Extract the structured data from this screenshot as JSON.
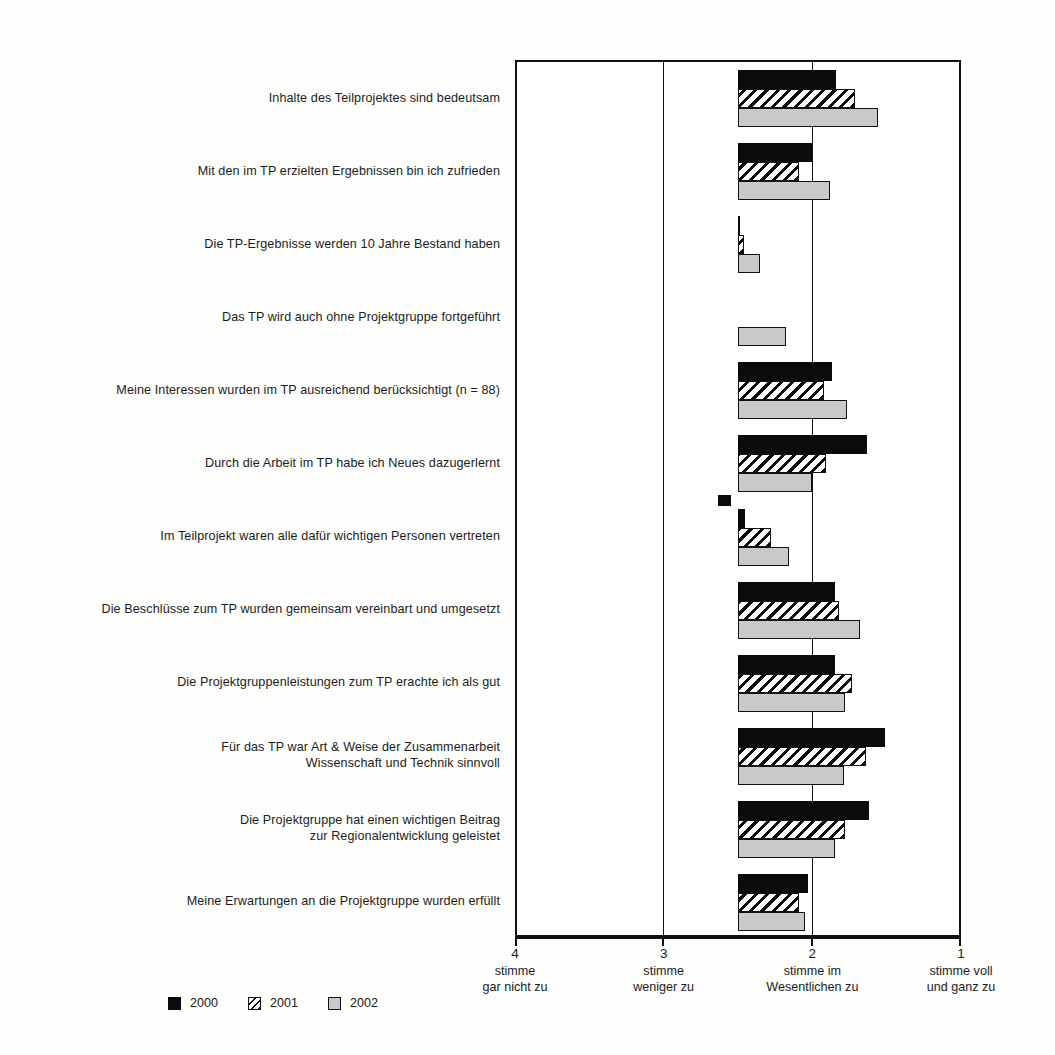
{
  "chart_data": {
    "type": "bar",
    "orientation": "horizontal",
    "title": "",
    "subtitle": "",
    "xlabel": "",
    "ylabel": "",
    "xlim": [
      4,
      1
    ],
    "x_inverted": true,
    "bar_baseline": 2.5,
    "grid": true,
    "gridlines": [
      4,
      3,
      2,
      1
    ],
    "legend_position": "bottom-left",
    "annotation": "n = 88",
    "axis_ticks": [
      {
        "value": "4",
        "line1": "stimme",
        "line2": "gar nicht zu"
      },
      {
        "value": "3",
        "line1": "stimme",
        "line2": "weniger zu"
      },
      {
        "value": "2",
        "line1": "stimme im",
        "line2": "Wesentlichen zu"
      },
      {
        "value": "1",
        "line1": "stimme voll",
        "line2": "und ganz zu"
      }
    ],
    "legend": [
      {
        "name": "2000",
        "color": "#0b0b0b",
        "pattern": "solid-black"
      },
      {
        "name": "2001",
        "color": "#ffffff",
        "pattern": "diagonal-hatch"
      },
      {
        "name": "2002",
        "color": "#c9c9c9",
        "pattern": "solid-gray"
      }
    ],
    "categories": [
      "Inhalte des Teilprojektes sind bedeutsam",
      "Mit den im TP erzielten Ergebnissen bin ich zufrieden",
      "Die TP-Ergebnisse werden 10 Jahre Bestand haben",
      "Das TP wird auch ohne Projektgruppe fortgeführt",
      "Meine Interessen wurden im TP ausreichend berücksichtigt (n = 88)",
      "Durch die Arbeit im TP habe ich Neues dazugerlernt",
      "Im Teilprojekt waren alle dafür wichtigen Personen vertreten",
      "Die Beschlüsse zum TP wurden gemeinsam vereinbart und umgesetzt",
      "Die Projektgruppenleistungen zum TP erachte ich als gut",
      "Für das TP war Art & Weise der Zusammenarbeit Wissenschaft und Technik sinnvoll",
      "Die Projektgruppe hat einen wichtigen Beitrag zur Regionalentwicklung geleistet",
      "Meine Erwartungen an die Projektgruppe wurden erfüllt"
    ],
    "categories_wrapped": [
      [
        "Inhalte des Teilprojektes sind bedeutsam"
      ],
      [
        "Mit den im TP erzielten Ergebnissen bin ich zufrieden"
      ],
      [
        "Die TP-Ergebnisse werden 10 Jahre Bestand haben"
      ],
      [
        "Das TP wird auch ohne Projektgruppe fortgeführt"
      ],
      [
        "Meine Interessen wurden im TP ausreichend berücksichtigt (n = 88)"
      ],
      [
        "Durch die Arbeit im TP habe ich Neues dazugerlernt"
      ],
      [
        "Im Teilprojekt waren alle dafür wichtigen Personen vertreten"
      ],
      [
        "Die Beschlüsse zum TP wurden gemeinsam vereinbart und umgesetzt"
      ],
      [
        "Die Projektgruppenleistungen zum TP erachte ich als gut"
      ],
      [
        "Für das TP war Art & Weise der Zusammenarbeit",
        "Wissenschaft und Technik sinnvoll"
      ],
      [
        "Die Projektgruppe hat einen wichtigen Beitrag",
        "zur Regionalentwicklung geleistet"
      ],
      [
        "Meine Erwartungen an die Projektgruppe wurden erfüllt"
      ]
    ],
    "series": [
      {
        "name": "2000",
        "values": [
          1.84,
          2.0,
          2.49,
          null,
          1.87,
          1.63,
          2.45,
          1.85,
          1.85,
          1.51,
          1.62,
          2.03
        ]
      },
      {
        "name": "2001",
        "values": [
          1.71,
          2.09,
          2.46,
          null,
          1.92,
          1.91,
          2.28,
          1.82,
          1.73,
          1.64,
          1.78,
          2.09
        ]
      },
      {
        "name": "2002",
        "values": [
          1.56,
          1.88,
          2.35,
          2.18,
          1.77,
          2.0,
          2.16,
          1.68,
          1.78,
          1.79,
          1.85,
          2.05
        ]
      }
    ],
    "markers": [
      {
        "series": "2000",
        "category_index": 6,
        "value": 2.55,
        "note": "outlier-square-left-of-baseline"
      }
    ]
  }
}
